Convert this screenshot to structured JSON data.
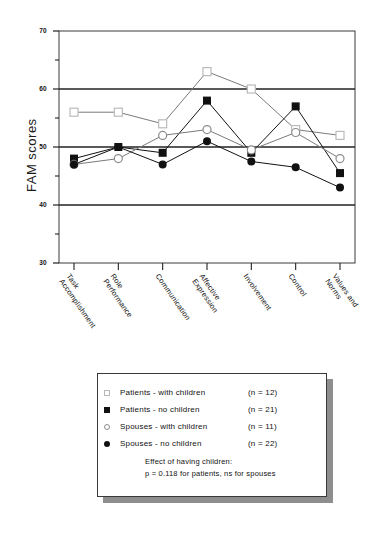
{
  "chart_data": {
    "type": "line",
    "title": "",
    "xlabel": "",
    "ylabel": "FAM scores",
    "ylim": [
      30,
      70
    ],
    "yticks": [
      30,
      40,
      50,
      60,
      70
    ],
    "yminorticks": [
      35,
      45,
      55,
      65
    ],
    "grid": "horizontal-major",
    "legend_position": "below-plot",
    "categories": [
      "Task Accomplishment",
      "Role Performance",
      "Communication",
      "Affective Expression",
      "Involvement",
      "Control",
      "Values and Norms"
    ],
    "series": [
      {
        "name": "Patients - with children (n = 12)",
        "marker": "open-square",
        "color": "#b9b9b9",
        "values": [
          56.0,
          56.0,
          54.0,
          63.0,
          60.0,
          53.0,
          52.0
        ]
      },
      {
        "name": "Patients - no children (n = 21)",
        "marker": "filled-square",
        "color": "#111111",
        "values": [
          48.0,
          50.0,
          49.0,
          58.0,
          49.0,
          57.0,
          45.5
        ]
      },
      {
        "name": "Spouses - with children (n = 11)",
        "marker": "open-circle",
        "color": "#8c8c8c",
        "values": [
          47.0,
          48.0,
          52.0,
          53.0,
          49.5,
          52.5,
          48.0
        ]
      },
      {
        "name": "Spouses - no children (n = 22)",
        "marker": "filled-circle",
        "color": "#111111",
        "values": [
          47.0,
          50.0,
          47.0,
          51.0,
          47.5,
          46.5,
          43.0
        ]
      }
    ],
    "annotations": [
      "Effect of having children:",
      "p = 0.118 for patients, ns for spouses"
    ]
  },
  "legend": {
    "rows": [
      {
        "marker": "open-square",
        "label": "Patients  -  with children",
        "n_text": "(n = 12)"
      },
      {
        "marker": "filled-square",
        "label": "Patients  -  no children",
        "n_text": "(n = 21)"
      },
      {
        "marker": "open-circle",
        "label": "Spouses  -  with children",
        "n_text": "(n = 11)"
      },
      {
        "marker": "filled-circle",
        "label": "Spouses  -  no children",
        "n_text": "(n = 22)"
      }
    ],
    "note_line_1": "Effect of having children:",
    "note_line_2": "p = 0.118 for patients, ns for spouses"
  }
}
